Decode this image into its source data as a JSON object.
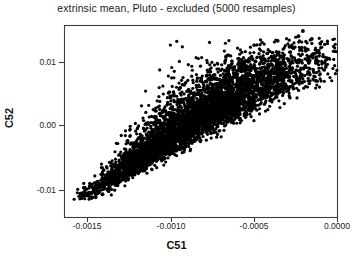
{
  "chart_data": {
    "type": "scatter",
    "title": "extrinsic mean, Pluto - excluded (5000 resamples)",
    "xlabel": "C51",
    "ylabel": "C52",
    "n_points": 5000,
    "resamples": 5000,
    "grid": false,
    "legend": null,
    "point_color": "#000000",
    "point_size_px": 3.2,
    "xlim": [
      -0.001785,
      5.5e-05
    ],
    "ylim": [
      -0.0142,
      0.01485
    ],
    "xticks": [
      -0.0015,
      -0.001,
      -0.0005,
      0.0
    ],
    "xtick_labels": [
      "-0.0015",
      "-0.0010",
      "-0.0005",
      "0.0000"
    ],
    "yticks": [
      0.01,
      0.0,
      -0.01
    ],
    "ytick_labels": [
      "0.01",
      "0.00",
      "-0.01"
    ],
    "cloud": {
      "x_start": -0.001655,
      "y_start": -0.01155,
      "x_end": -0.000105,
      "y_end": 0.01305,
      "correlation": 0.985,
      "width_start": 5e-05,
      "width_end": 0.00031,
      "spread_start": 0.00055,
      "spread_end": 0.00235
    },
    "outliers": [
      {
        "x": -0.000175,
        "y": 0.01395
      },
      {
        "x": -0.000205,
        "y": 0.01315
      },
      {
        "x": -0.000115,
        "y": 0.01275
      },
      {
        "x": -0.000345,
        "y": 0.01245
      },
      {
        "x": -0.000265,
        "y": 0.01155
      },
      {
        "x": -0.000155,
        "y": 0.01095
      },
      {
        "x": -0.000415,
        "y": 0.01055
      },
      {
        "x": -0.000305,
        "y": 0.00985
      },
      {
        "x": -0.000495,
        "y": 0.00935
      },
      {
        "x": -0.000385,
        "y": 0.00885
      },
      {
        "x": -0.000585,
        "y": 0.00825
      },
      {
        "x": -0.000465,
        "y": 0.00765
      },
      {
        "x": -0.001525,
        "y": -0.01075
      }
    ]
  },
  "frame": {
    "left_px": 64,
    "right_px": 337,
    "top_px": 25,
    "bottom_px": 217,
    "border_color": "#3d3d3d"
  },
  "axis_pixels": {
    "xtick_px": [
      87,
      171,
      254,
      337
    ],
    "ytick_px": [
      62,
      125,
      190
    ]
  }
}
